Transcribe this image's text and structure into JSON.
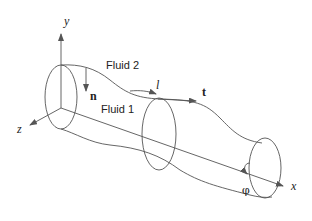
{
  "diagram": {
    "axes": {
      "y": "y",
      "z": "z",
      "x": "x"
    },
    "regions": {
      "outer": "Fluid 2",
      "inner": "Fluid 1"
    },
    "vectors": {
      "normal": "n",
      "tangent": "t"
    },
    "arc_length": "l",
    "azimuthal_angle": "φ",
    "colors": {
      "stroke": "#555555",
      "text": "#222222",
      "background": "#ffffff"
    }
  }
}
